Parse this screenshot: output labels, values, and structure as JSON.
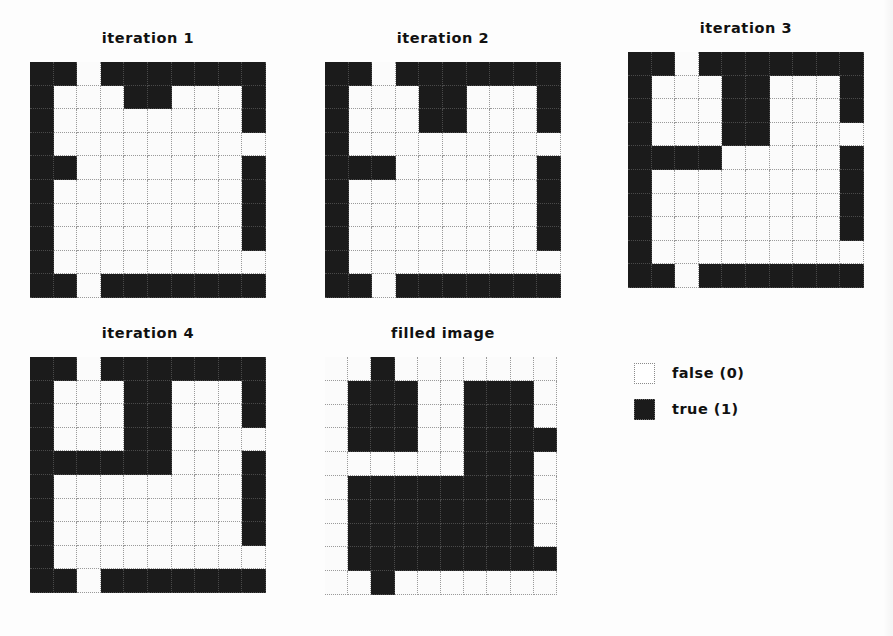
{
  "figure": {
    "caption": "",
    "legend": {
      "items": [
        {
          "label": "false (0)",
          "state": "false",
          "color": "#ffffff"
        },
        {
          "label": "true (1)",
          "state": "true",
          "color": "#1b1b1b"
        }
      ]
    }
  },
  "panels": [
    {
      "id": "iter1",
      "title": "iteration 1"
    },
    {
      "id": "iter2",
      "title": "iteration 2"
    },
    {
      "id": "iter3",
      "title": "iteration 3"
    },
    {
      "id": "iter4",
      "title": "iteration 4"
    },
    {
      "id": "filled",
      "title": "filled image"
    }
  ],
  "chart_data": {
    "type": "heatmap",
    "xlabel": "",
    "ylabel": "",
    "rows": 10,
    "cols": 10,
    "value_map": {
      "0": "false (0)",
      "1": "true (1)"
    },
    "colors": {
      "0": "#ffffff",
      "1": "#1b1b1b"
    },
    "grids": [
      {
        "name": "iteration 1",
        "values": [
          [
            1,
            1,
            0,
            1,
            1,
            1,
            1,
            1,
            1,
            1
          ],
          [
            1,
            0,
            0,
            0,
            1,
            1,
            0,
            0,
            0,
            1
          ],
          [
            1,
            0,
            0,
            0,
            0,
            0,
            0,
            0,
            0,
            1
          ],
          [
            1,
            0,
            0,
            0,
            0,
            0,
            0,
            0,
            0,
            0
          ],
          [
            1,
            1,
            0,
            0,
            0,
            0,
            0,
            0,
            0,
            1
          ],
          [
            1,
            0,
            0,
            0,
            0,
            0,
            0,
            0,
            0,
            1
          ],
          [
            1,
            0,
            0,
            0,
            0,
            0,
            0,
            0,
            0,
            1
          ],
          [
            1,
            0,
            0,
            0,
            0,
            0,
            0,
            0,
            0,
            1
          ],
          [
            1,
            0,
            0,
            0,
            0,
            0,
            0,
            0,
            0,
            0
          ],
          [
            1,
            1,
            0,
            1,
            1,
            1,
            1,
            1,
            1,
            1
          ]
        ]
      },
      {
        "name": "iteration 2",
        "values": [
          [
            1,
            1,
            0,
            1,
            1,
            1,
            1,
            1,
            1,
            1
          ],
          [
            1,
            0,
            0,
            0,
            1,
            1,
            0,
            0,
            0,
            1
          ],
          [
            1,
            0,
            0,
            0,
            1,
            1,
            0,
            0,
            0,
            1
          ],
          [
            1,
            0,
            0,
            0,
            0,
            0,
            0,
            0,
            0,
            0
          ],
          [
            1,
            1,
            1,
            0,
            0,
            0,
            0,
            0,
            0,
            1
          ],
          [
            1,
            0,
            0,
            0,
            0,
            0,
            0,
            0,
            0,
            1
          ],
          [
            1,
            0,
            0,
            0,
            0,
            0,
            0,
            0,
            0,
            1
          ],
          [
            1,
            0,
            0,
            0,
            0,
            0,
            0,
            0,
            0,
            1
          ],
          [
            1,
            0,
            0,
            0,
            0,
            0,
            0,
            0,
            0,
            0
          ],
          [
            1,
            1,
            0,
            1,
            1,
            1,
            1,
            1,
            1,
            1
          ]
        ]
      },
      {
        "name": "iteration 3",
        "values": [
          [
            1,
            1,
            0,
            1,
            1,
            1,
            1,
            1,
            1,
            1
          ],
          [
            1,
            0,
            0,
            0,
            1,
            1,
            0,
            0,
            0,
            1
          ],
          [
            1,
            0,
            0,
            0,
            1,
            1,
            0,
            0,
            0,
            1
          ],
          [
            1,
            0,
            0,
            0,
            1,
            1,
            0,
            0,
            0,
            0
          ],
          [
            1,
            1,
            1,
            1,
            0,
            0,
            0,
            0,
            0,
            1
          ],
          [
            1,
            0,
            0,
            0,
            0,
            0,
            0,
            0,
            0,
            1
          ],
          [
            1,
            0,
            0,
            0,
            0,
            0,
            0,
            0,
            0,
            1
          ],
          [
            1,
            0,
            0,
            0,
            0,
            0,
            0,
            0,
            0,
            1
          ],
          [
            1,
            0,
            0,
            0,
            0,
            0,
            0,
            0,
            0,
            0
          ],
          [
            1,
            1,
            0,
            1,
            1,
            1,
            1,
            1,
            1,
            1
          ]
        ]
      },
      {
        "name": "iteration 4",
        "values": [
          [
            1,
            1,
            0,
            1,
            1,
            1,
            1,
            1,
            1,
            1
          ],
          [
            1,
            0,
            0,
            0,
            1,
            1,
            0,
            0,
            0,
            1
          ],
          [
            1,
            0,
            0,
            0,
            1,
            1,
            0,
            0,
            0,
            1
          ],
          [
            1,
            0,
            0,
            0,
            1,
            1,
            0,
            0,
            0,
            0
          ],
          [
            1,
            1,
            1,
            1,
            1,
            1,
            0,
            0,
            0,
            1
          ],
          [
            1,
            0,
            0,
            0,
            0,
            0,
            0,
            0,
            0,
            1
          ],
          [
            1,
            0,
            0,
            0,
            0,
            0,
            0,
            0,
            0,
            1
          ],
          [
            1,
            0,
            0,
            0,
            0,
            0,
            0,
            0,
            0,
            1
          ],
          [
            1,
            0,
            0,
            0,
            0,
            0,
            0,
            0,
            0,
            0
          ],
          [
            1,
            1,
            0,
            1,
            1,
            1,
            1,
            1,
            1,
            1
          ]
        ]
      },
      {
        "name": "filled image",
        "values": [
          [
            0,
            0,
            1,
            0,
            0,
            0,
            0,
            0,
            0,
            0
          ],
          [
            0,
            1,
            1,
            1,
            0,
            0,
            1,
            1,
            1,
            0
          ],
          [
            0,
            1,
            1,
            1,
            0,
            0,
            1,
            1,
            1,
            0
          ],
          [
            0,
            1,
            1,
            1,
            0,
            0,
            1,
            1,
            1,
            1
          ],
          [
            0,
            0,
            0,
            0,
            0,
            0,
            1,
            1,
            1,
            0
          ],
          [
            0,
            1,
            1,
            1,
            1,
            1,
            1,
            1,
            1,
            0
          ],
          [
            0,
            1,
            1,
            1,
            1,
            1,
            1,
            1,
            1,
            0
          ],
          [
            0,
            1,
            1,
            1,
            1,
            1,
            1,
            1,
            1,
            0
          ],
          [
            0,
            1,
            1,
            1,
            1,
            1,
            1,
            1,
            1,
            1
          ],
          [
            0,
            0,
            1,
            0,
            0,
            0,
            0,
            0,
            0,
            0
          ]
        ]
      }
    ]
  }
}
